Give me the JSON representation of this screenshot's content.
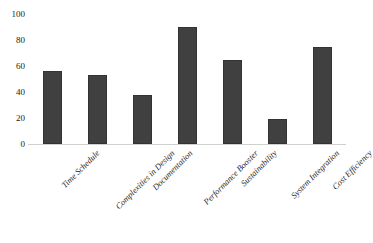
{
  "chart_data": {
    "type": "bar",
    "title": "",
    "subtitle": "",
    "xlabel": "",
    "ylabel": "",
    "categories": [
      "Time Schedule",
      "Complexities in Design",
      "Documentation",
      "Performance Booster",
      "Sustainability",
      "System Integration",
      "Cost Efficiency"
    ],
    "values": [
      56,
      53,
      38,
      90,
      65,
      19,
      75
    ],
    "ylim": [
      0,
      100
    ],
    "y_ticks": [
      "0",
      "20",
      "40",
      "60",
      "80",
      "100"
    ],
    "y_tick_values": [
      0,
      20,
      40,
      60,
      80,
      100
    ],
    "grid": false,
    "legend": false,
    "legend_position": "none",
    "bar_color": "#404040",
    "axis_color": "#d0d0d0",
    "text_color": "#262626"
  }
}
